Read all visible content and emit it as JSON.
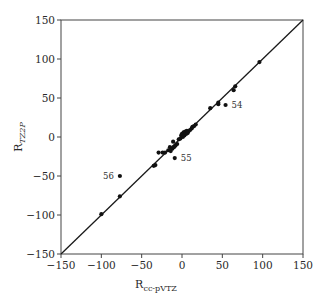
{
  "chart_data": {
    "type": "scatter",
    "title": "",
    "xlabel": "R",
    "xlabel_sub": "cc-pVTZ",
    "ylabel": "R",
    "ylabel_sub": "TZ2P",
    "xlim": [
      -150,
      150
    ],
    "ylim": [
      -150,
      150
    ],
    "xticks": [
      -150,
      -100,
      -50,
      0,
      50,
      100,
      150
    ],
    "yticks": [
      -150,
      -100,
      -50,
      0,
      50,
      100,
      150
    ],
    "xtick_labels": [
      "−150",
      "−100",
      "−50",
      "0",
      "50",
      "100",
      "150"
    ],
    "ytick_labels": [
      "−150",
      "−100",
      "−50",
      "0",
      "50",
      "100",
      "150"
    ],
    "grid": false,
    "reference_line": {
      "type": "y=x",
      "from": [
        -150,
        -150
      ],
      "to": [
        150,
        150
      ]
    },
    "colors": {
      "points": "#111111",
      "line": "#1a1a1a",
      "frame": "#444444"
    },
    "points": [
      {
        "x": -100,
        "y": -99
      },
      {
        "x": -77,
        "y": -76
      },
      {
        "x": -77,
        "y": -50,
        "label": "56"
      },
      {
        "x": -35,
        "y": -37
      },
      {
        "x": -33,
        "y": -36
      },
      {
        "x": -29,
        "y": -20
      },
      {
        "x": -24,
        "y": -20
      },
      {
        "x": -21,
        "y": -20
      },
      {
        "x": -17,
        "y": -17
      },
      {
        "x": -15,
        "y": -13
      },
      {
        "x": -14,
        "y": -18
      },
      {
        "x": -12,
        "y": -15
      },
      {
        "x": -11,
        "y": -6
      },
      {
        "x": -10,
        "y": -13
      },
      {
        "x": -9,
        "y": -27,
        "label": "55"
      },
      {
        "x": -8,
        "y": -11
      },
      {
        "x": -6,
        "y": -9
      },
      {
        "x": -4,
        "y": -3
      },
      {
        "x": -2,
        "y": -2
      },
      {
        "x": -1,
        "y": 2
      },
      {
        "x": 0,
        "y": 4
      },
      {
        "x": 1,
        "y": 0
      },
      {
        "x": 2,
        "y": 6
      },
      {
        "x": 3,
        "y": 2
      },
      {
        "x": 4,
        "y": 7
      },
      {
        "x": 5,
        "y": 4
      },
      {
        "x": 6,
        "y": 8
      },
      {
        "x": 7,
        "y": 5
      },
      {
        "x": 8,
        "y": 7
      },
      {
        "x": 10,
        "y": 9
      },
      {
        "x": 12,
        "y": 11
      },
      {
        "x": 13,
        "y": 13
      },
      {
        "x": 15,
        "y": 14
      },
      {
        "x": 17,
        "y": 16
      },
      {
        "x": 35,
        "y": 37
      },
      {
        "x": 45,
        "y": 42
      },
      {
        "x": 45,
        "y": 44
      },
      {
        "x": 54,
        "y": 41,
        "label": "54"
      },
      {
        "x": 64,
        "y": 60
      },
      {
        "x": 66,
        "y": 65
      },
      {
        "x": 96,
        "y": 96
      }
    ]
  }
}
